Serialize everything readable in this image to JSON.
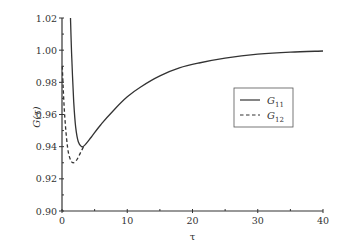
{
  "chart_data": {
    "type": "line",
    "title": "",
    "xlabel": "τ",
    "ylabel": "G(τ)",
    "xlim": [
      0,
      40
    ],
    "ylim": [
      0.9,
      1.02
    ],
    "xticks": [
      0,
      10,
      20,
      30,
      40
    ],
    "xtick_labels": [
      "0",
      "10",
      "20",
      "30",
      "40"
    ],
    "yticks": [
      0.9,
      0.92,
      0.94,
      0.96,
      0.98,
      1.0,
      1.02
    ],
    "ytick_labels": [
      "0.90",
      "0.92",
      "0.94",
      "0.96",
      "0.98",
      "1.00",
      "1.02"
    ],
    "grid": false,
    "legend_position": "center-right",
    "series": [
      {
        "name": "G11",
        "label_main": "G",
        "label_sub": "11",
        "style": "solid",
        "color": "#333333",
        "x": [
          1.3,
          1.5,
          1.8,
          2.1,
          2.5,
          3.0,
          3.5,
          4.5,
          6,
          8,
          10,
          12,
          15,
          18,
          21,
          25,
          30,
          35,
          40
        ],
        "y": [
          1.02,
          0.995,
          0.968,
          0.952,
          0.943,
          0.94,
          0.941,
          0.946,
          0.954,
          0.963,
          0.971,
          0.977,
          0.984,
          0.989,
          0.992,
          0.995,
          0.9975,
          0.9988,
          0.9995
        ]
      },
      {
        "name": "G12",
        "label_main": "G",
        "label_sub": "12",
        "style": "dashed",
        "color": "#333333",
        "x": [
          0.05,
          0.2,
          0.4,
          0.7,
          1.0,
          1.4,
          1.8,
          2.3,
          2.8,
          3.3
        ],
        "y": [
          0.99,
          0.975,
          0.96,
          0.945,
          0.936,
          0.931,
          0.93,
          0.932,
          0.936,
          0.94
        ]
      }
    ]
  }
}
